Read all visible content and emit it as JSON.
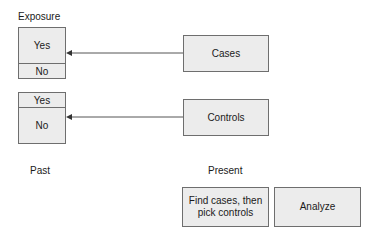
{
  "labels": {
    "exposure": "Exposure",
    "past": "Past",
    "present": "Present"
  },
  "exposure_boxes": [
    {
      "top": "Yes",
      "bottom": "No",
      "emphasis": "top"
    },
    {
      "top": "Yes",
      "bottom": "No",
      "emphasis": "bottom"
    }
  ],
  "groups": {
    "cases": "Cases",
    "controls": "Controls"
  },
  "steps": {
    "find": "Find cases, then pick controls",
    "analyze": "Analyze"
  },
  "colors": {
    "box_fill": "#ececec",
    "border": "#6e6e6e",
    "arrow": "#555555"
  }
}
